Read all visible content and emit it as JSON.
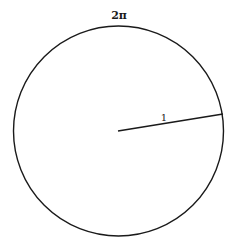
{
  "diagram": {
    "circumference_label": "2π",
    "radius_label": "1",
    "colors": {
      "stroke": "#1a1a1a",
      "background": "#ffffff"
    }
  }
}
